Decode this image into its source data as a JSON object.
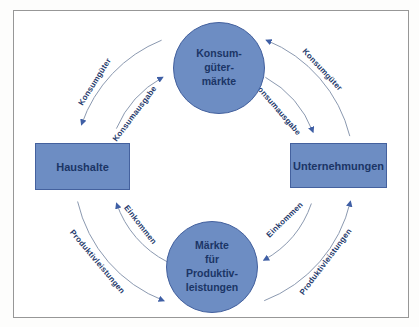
{
  "diagram": {
    "nodes": {
      "konsumgueter_maerkte": {
        "label": "Konsum-\ngüter-\nmärkte",
        "shape": "circle"
      },
      "haushalte": {
        "label": "Haushalte",
        "shape": "rectangle"
      },
      "unternehmungen": {
        "label": "Unternehmungen",
        "shape": "rectangle"
      },
      "produktiv_maerkte": {
        "label": "Märkte\nfür\nProduktiv-\nleistungen",
        "shape": "circle"
      }
    },
    "flows": {
      "tl_outer": {
        "label": "Konsumgüter",
        "from": "Konsumgütermärkte",
        "to": "Haushalte"
      },
      "tl_inner": {
        "label": "Konsumausgabe",
        "from": "Haushalte",
        "to": "Konsumgütermärkte"
      },
      "tr_outer": {
        "label": "Konsumgüter",
        "from": "Unternehmungen",
        "to": "Konsumgütermärkte"
      },
      "tr_inner": {
        "label": "Konsumausgabe",
        "from": "Konsumgütermärkte",
        "to": "Unternehmungen"
      },
      "bl_inner": {
        "label": "Einkommen",
        "from": "Märkte für Produktivleistungen",
        "to": "Haushalte"
      },
      "bl_outer": {
        "label": "Produktivleistungen",
        "from": "Haushalte",
        "to": "Märkte für Produktivleistungen"
      },
      "br_inner": {
        "label": "Einkommen",
        "from": "Unternehmungen",
        "to": "Märkte für Produktivleistungen"
      },
      "br_outer": {
        "label": "Produktivleistungen",
        "from": "Märkte für Produktivleistungen",
        "to": "Unternehmungen"
      }
    },
    "colors": {
      "node_fill": "#6d8dc3",
      "node_border": "#44619e",
      "node_text": "#1b3566",
      "arrow_line": "#8b99b0",
      "arrow_head": "#3f5fa5",
      "flow_label_text": "#24396b",
      "frame_border": "#979797",
      "background": "#ffffff"
    }
  }
}
